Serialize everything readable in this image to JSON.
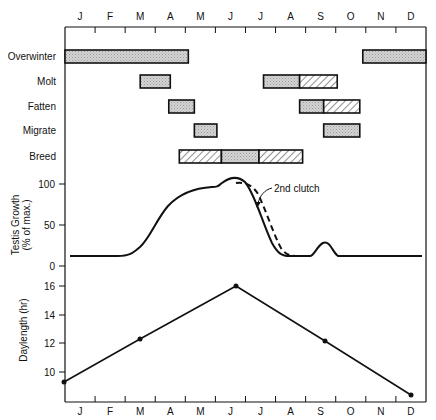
{
  "chart_data": [
    {
      "type": "table",
      "title": "Annual cycle activities",
      "months": [
        "J",
        "F",
        "M",
        "A",
        "M",
        "J",
        "J",
        "A",
        "S",
        "O",
        "N",
        "D"
      ],
      "rows": [
        {
          "label": "Overwinter",
          "bars": [
            {
              "start": 0.0,
              "end": 4.1,
              "fill": "stipple"
            },
            {
              "start": 9.9,
              "end": 12.0,
              "fill": "stipple"
            }
          ]
        },
        {
          "label": "Molt",
          "bars": [
            {
              "start": 2.5,
              "end": 3.5,
              "fill": "stipple"
            },
            {
              "start": 6.6,
              "end": 7.8,
              "fill": "stipple"
            },
            {
              "start": 7.8,
              "end": 9.05,
              "fill": "hatch"
            }
          ]
        },
        {
          "label": "Fatten",
          "bars": [
            {
              "start": 3.45,
              "end": 4.3,
              "fill": "stipple"
            },
            {
              "start": 7.8,
              "end": 8.6,
              "fill": "stipple"
            },
            {
              "start": 8.6,
              "end": 9.8,
              "fill": "hatch"
            }
          ]
        },
        {
          "label": "Migrate",
          "bars": [
            {
              "start": 4.3,
              "end": 5.05,
              "fill": "stipple"
            },
            {
              "start": 8.6,
              "end": 9.8,
              "fill": "stipple"
            }
          ]
        },
        {
          "label": "Breed",
          "bars": [
            {
              "start": 3.8,
              "end": 5.2,
              "fill": "hatch"
            },
            {
              "start": 5.2,
              "end": 6.45,
              "fill": "stipple"
            },
            {
              "start": 6.45,
              "end": 7.9,
              "fill": "hatch"
            }
          ]
        }
      ]
    },
    {
      "type": "line",
      "ylabel": "Testis Growth (% of max.)",
      "yticks": [
        0,
        50,
        100
      ],
      "ylim": [
        0,
        100
      ],
      "annotation": "2nd clutch",
      "series": [
        {
          "name": "Testis growth",
          "style": "solid",
          "x": [
            0.0,
            1.0,
            2.0,
            2.5,
            3.0,
            3.5,
            4.0,
            4.5,
            5.0,
            5.5,
            5.8,
            6.0,
            6.5,
            7.0,
            7.3,
            7.8,
            8.2,
            8.5,
            8.8,
            9.1,
            9.3,
            10.0,
            11.0,
            11.9
          ],
          "y": [
            10,
            10,
            10,
            12,
            30,
            60,
            80,
            88,
            90,
            100,
            98,
            85,
            40,
            12,
            10,
            10,
            10,
            10,
            26,
            10,
            10,
            10,
            10,
            10
          ]
        },
        {
          "name": "2nd clutch",
          "style": "dashed",
          "x": [
            5.7,
            6.2,
            6.6,
            7.0,
            7.4,
            7.8
          ],
          "y": [
            100,
            95,
            65,
            35,
            12,
            10
          ]
        }
      ]
    },
    {
      "type": "line",
      "ylabel": "Daylength (hr)",
      "yticks": [
        10,
        12,
        14,
        16
      ],
      "ylim": [
        8,
        16.5
      ],
      "categories": [
        "J",
        "F",
        "M",
        "A",
        "M",
        "J",
        "J",
        "A",
        "S",
        "O",
        "N",
        "D"
      ],
      "series": [
        {
          "name": "Daylength",
          "x": [
            0.0,
            2.5,
            5.7,
            8.7,
            11.6
          ],
          "y": [
            9.3,
            12.3,
            16.0,
            12.2,
            8.4
          ]
        }
      ]
    }
  ],
  "labels": {
    "months": [
      "J",
      "F",
      "M",
      "A",
      "M",
      "J",
      "J",
      "A",
      "S",
      "O",
      "N",
      "D"
    ],
    "rows": [
      "Overwinter",
      "Molt",
      "Fatten",
      "Migrate",
      "Breed"
    ],
    "testis_ylabel_1": "Testis Growth",
    "testis_ylabel_2": "(% of max.)",
    "testis_ticks": [
      "100",
      "50",
      "0"
    ],
    "daylength_ylabel": "Daylength (hr)",
    "daylength_ticks": [
      "16",
      "14",
      "12",
      "10"
    ],
    "annotation": "2nd clutch"
  },
  "colors": {
    "ink": "#111111",
    "stipple": "#c8c8c8",
    "background": "#ffffff"
  }
}
